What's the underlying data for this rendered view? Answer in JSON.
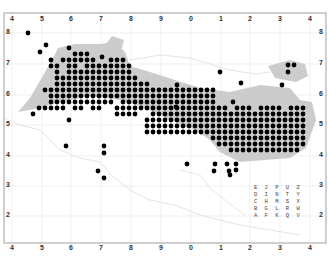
{
  "map": {
    "frame": {
      "left": 4,
      "top": 13,
      "right": 326,
      "bottom": 243
    },
    "x_labels": [
      "4",
      "5",
      "6",
      "7",
      "8",
      "9",
      "0",
      "1",
      "2",
      "3",
      "4"
    ],
    "x_label_positions": [
      12,
      42,
      71,
      101,
      131,
      161,
      191,
      221,
      250,
      280,
      310
    ],
    "y_labels": [
      "8",
      "7",
      "6",
      "5",
      "4",
      "3",
      "2"
    ],
    "y_label_positions": [
      33,
      64,
      95,
      125,
      156,
      186,
      216
    ],
    "key_rows": [
      "EJPUZ",
      "DINTY",
      "CHMSX",
      "BGLRW",
      "AFKQV"
    ],
    "colors": {
      "dot": "#000000",
      "land": "#cccccc",
      "grid": "#e6e6e6",
      "frame": "#888888",
      "coast": "#d8d8d8"
    },
    "dot_grid": {
      "origin_x": 21,
      "origin_y": 42,
      "cell": 6,
      "rows": [
        "000000000000000000000000000000000000000000000000",
        "000000001000000000000000000000000000000000000000",
        "000000000111000000000000000000000000000000000000",
        "000001011111100111000000000000000000000000000000",
        "000001101101111111100000000000000000000000000000",
        "000000101111111111100000000000000000000000000000",
        "000000111111111111110000000000000000000000000000",
        "000000111111111111111100000000000000000000000000",
        "000011111111111111111111111111111000000000000000",
        "000001111111111111111111111111111000000000000000",
        "000001111111111101111111111111111000000000000000",
        "000111110110110011111111111111111110111011110111",
        "001000000000000011110011111111111111111111111111",
        "000000001000000000000111111111111111111111111111",
        "000000000000000000000111111111111111111111111111",
        "000000000000000000000111111111111111111111111111",
        "000000000000000000000000000000001111111111111111",
        "000000000000000000000000000000000111111111111111",
        "000000000000000000000000000000000001111111111110"
      ],
      "extra_dots": [
        [
          28,
          33
        ],
        [
          40,
          52
        ],
        [
          46,
          45
        ],
        [
          102,
          57
        ],
        [
          177,
          85
        ],
        [
          176,
          107
        ],
        [
          241,
          83
        ],
        [
          282,
          85
        ],
        [
          233,
          102
        ],
        [
          288,
          65
        ],
        [
          294,
          65
        ],
        [
          288,
          72
        ],
        [
          220,
          72
        ]
      ]
    },
    "isolated_dots": [
      [
        66,
        146
      ],
      [
        104,
        146
      ],
      [
        104,
        153
      ],
      [
        98,
        171
      ],
      [
        104,
        178
      ],
      [
        187,
        164
      ],
      [
        215,
        164
      ],
      [
        214,
        171
      ],
      [
        227,
        164
      ],
      [
        229,
        171
      ],
      [
        230,
        175
      ],
      [
        236,
        164
      ],
      [
        236,
        170
      ]
    ]
  }
}
